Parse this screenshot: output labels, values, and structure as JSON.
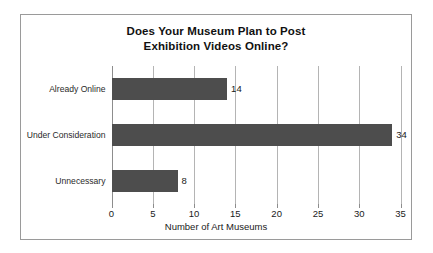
{
  "chart_data": {
    "type": "bar",
    "orientation": "horizontal",
    "title": "Does Your Museum Plan to Post Exhibition Videos Online?",
    "title_lines": [
      "Does Your Museum Plan to Post",
      "Exhibition Videos Online?"
    ],
    "categories": [
      "Already Online",
      "Under Consideration",
      "Unnecessary"
    ],
    "values": [
      14,
      34,
      8
    ],
    "data_labels": [
      "14",
      "34",
      "8"
    ],
    "xlabel": "Number of Art Museums",
    "ylabel": "",
    "xlim": [
      0,
      35
    ],
    "xticks": [
      0,
      5,
      10,
      15,
      20,
      25,
      30,
      35
    ],
    "xtick_labels": [
      "0",
      "5",
      "10",
      "15",
      "20",
      "25",
      "30",
      "35"
    ],
    "grid": "vertical",
    "legend": "none",
    "colors": {
      "bar": "#4d4d4d",
      "gridline": "#b4b4b4",
      "axis": "#8d8d8d",
      "frame_border": "#9a9a9a",
      "text": "#1a1a1a",
      "background": "#ffffff"
    }
  }
}
